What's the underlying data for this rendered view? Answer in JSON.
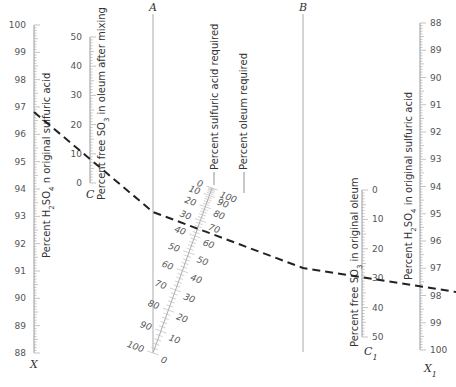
{
  "chart_data": {
    "type": "nomograph",
    "title": "",
    "axes": [
      {
        "id": "X",
        "name": "Percent H2SO4 in original sulfuric acid",
        "label_letter": "X",
        "min": 88,
        "max": 100,
        "major_ticks": [
          88,
          89,
          90,
          91,
          92,
          93,
          94,
          95,
          96,
          97,
          98,
          99,
          100
        ],
        "direction": "increasing upward"
      },
      {
        "id": "C",
        "name": "Percent free SO3 in oleum after mixing",
        "label_letter": "C",
        "min": 0,
        "max": 50,
        "major_ticks": [
          0,
          10,
          20,
          30,
          40,
          50
        ],
        "direction": "increasing upward"
      },
      {
        "id": "A",
        "name": "Reference line A",
        "label_letter": "A",
        "scale": "none"
      },
      {
        "id": "slant",
        "name": "Percent sulfuric acid required / Percent oleum required",
        "left_labels": [
          0,
          10,
          20,
          30,
          40,
          50,
          60,
          70,
          80,
          90,
          100
        ],
        "right_labels": [
          100,
          90,
          80,
          70,
          60,
          50,
          40,
          30,
          20,
          10,
          0
        ],
        "left_title": "Percent sulfuric acid required",
        "right_title": "Percent oleum required"
      },
      {
        "id": "B",
        "name": "Reference line B",
        "label_letter": "B",
        "scale": "none"
      },
      {
        "id": "C1",
        "name": "Percent free SO3 in original oleum",
        "label_letter": "C1",
        "min": 0,
        "max": 50,
        "major_ticks": [
          0,
          10,
          20,
          30,
          40,
          50
        ],
        "direction": "increasing downward"
      },
      {
        "id": "X1",
        "name": "Percent H2SO4 in original sulfuric acid",
        "label_letter": "X1",
        "min": 88,
        "max": 100,
        "major_ticks": [
          88,
          89,
          90,
          91,
          92,
          93,
          94,
          95,
          96,
          97,
          98,
          99,
          100
        ],
        "direction": "increasing downward"
      }
    ],
    "example_key_line": {
      "style": "dashed",
      "points": [
        {
          "axis": "X",
          "value": 97.8
        },
        {
          "axis": "C",
          "value": 12
        },
        {
          "axis": "A",
          "value": "pivot"
        },
        {
          "axis": "slant",
          "sulfuric_acid_required": 49,
          "oleum_required": 51
        },
        {
          "axis": "B",
          "value": "pivot"
        },
        {
          "axis": "C1",
          "value": 30
        },
        {
          "axis": "X1",
          "value": 97.8
        }
      ]
    }
  },
  "labels": {
    "x_title_a": "Percent H",
    "x_title_sub": "2",
    "x_title_b": "SO",
    "x_title_sub2": "4",
    "x_title_c": " n original sulfuric acid",
    "c_title_a": "Percent free SO",
    "c_title_sub": "3",
    "c_title_b": " in oleum after mixing",
    "slant_left_title": "Percent sulfuric acid required",
    "slant_right_title": "Percent oleum required",
    "c1_title_a": "Percent free SO",
    "c1_title_sub": "3",
    "c1_title_b": " in original oleum",
    "x1_title_a": "Percent H",
    "x1_title_sub": "2",
    "x1_title_b": "SO",
    "x1_title_sub2": "4",
    "x1_title_c": " in original sulfuric acid",
    "letter_x": "X",
    "letter_c": "C",
    "letter_a": "A",
    "letter_b": "B",
    "letter_c1": "C",
    "letter_c1_sub": "1",
    "letter_x1": "X",
    "letter_x1_sub": "1"
  },
  "colors": {
    "axis": "#999999",
    "ref_line": "#aaaaaa",
    "dashed_line": "#222222",
    "text": "#444444"
  }
}
